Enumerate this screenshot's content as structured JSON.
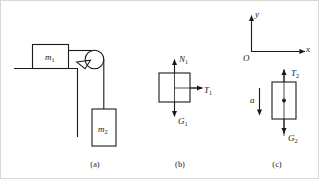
{
  "figure": {
    "background_color": "#ffffff",
    "line_color": "#1a1a1a",
    "captions": [
      {
        "key": "a",
        "label": "(a)"
      },
      {
        "key": "b",
        "label": "(b)"
      },
      {
        "key": "c",
        "label": "(c)"
      }
    ]
  },
  "panel_a": {
    "caption": "(a)",
    "description": "Block m1 on a table connected over a pulley to hanging block m2",
    "labels": {
      "block_top": {
        "base": "m",
        "sub": "1"
      },
      "block_hanging": {
        "base": "m",
        "sub": "2"
      }
    }
  },
  "panel_b": {
    "caption": "(b)",
    "description": "Free body diagram of block m1",
    "forces": [
      {
        "name": "normal-force",
        "base": "N",
        "sub": "1",
        "direction": "up"
      },
      {
        "name": "tension-force",
        "base": "T",
        "sub": "1",
        "direction": "right"
      },
      {
        "name": "gravity-force",
        "base": "G",
        "sub": "1",
        "direction": "down"
      }
    ]
  },
  "panel_c": {
    "caption": "(c)",
    "description": "Free body diagram of block m2 with acceleration a and coordinate axes",
    "axes": {
      "origin": "O",
      "x_label": "x",
      "y_label": "y"
    },
    "acceleration": {
      "base": "a",
      "sub": "",
      "direction": "down"
    },
    "forces": [
      {
        "name": "tension-force",
        "base": "T",
        "sub": "2",
        "direction": "up"
      },
      {
        "name": "gravity-force",
        "base": "G",
        "sub": "2",
        "direction": "down"
      }
    ]
  }
}
